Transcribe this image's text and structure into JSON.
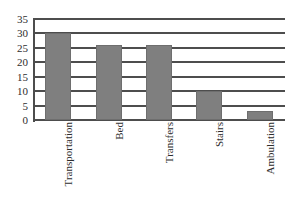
{
  "chart_data": {
    "type": "bar",
    "title": "",
    "xlabel": "",
    "ylabel": "",
    "categories": [
      "Transportation",
      "Bed",
      "Transfers",
      "Stairs",
      "Ambulation"
    ],
    "values": [
      30,
      26,
      26,
      10,
      3
    ],
    "ylim": [
      0,
      35
    ],
    "yticks": [
      0,
      5,
      10,
      15,
      20,
      25,
      30,
      35
    ],
    "ytick_labels": [
      "0",
      "5",
      "10",
      "15",
      "20",
      "25",
      "30",
      "35"
    ],
    "grid": true,
    "legend": false,
    "bar_color": "#7f7f7f",
    "grid_color": "#4d4d4d",
    "axis_color": "#4d4d4d",
    "background": "#ffffff"
  }
}
